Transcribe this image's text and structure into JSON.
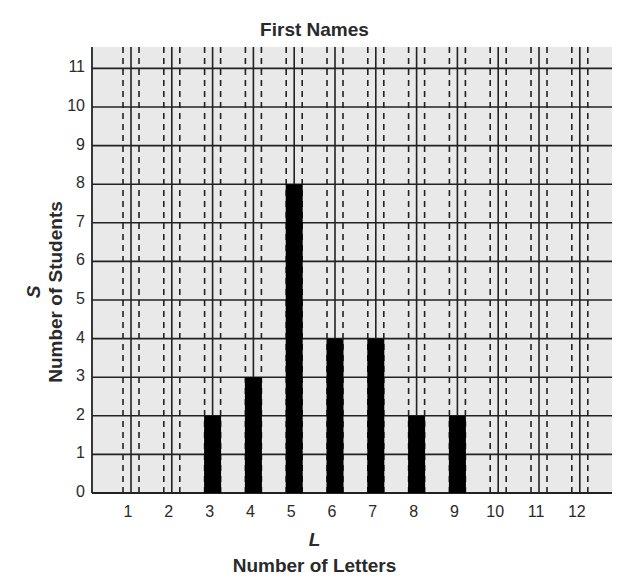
{
  "chart_data": {
    "type": "bar",
    "title": "First Names",
    "xlabel": "Number of Letters",
    "xvar": "L",
    "ylabel": "Number of Students",
    "yvar": "S",
    "categories": [
      "1",
      "2",
      "3",
      "4",
      "5",
      "6",
      "7",
      "8",
      "9",
      "10",
      "11",
      "12"
    ],
    "values": [
      0,
      0,
      2,
      3,
      8,
      4,
      4,
      2,
      2,
      0,
      0,
      0
    ],
    "ylim": [
      0,
      11
    ],
    "yticks": [
      "0",
      "1",
      "2",
      "3",
      "4",
      "5",
      "6",
      "7",
      "8",
      "9",
      "10",
      "11"
    ],
    "grid": true,
    "legend": null
  },
  "colors": {
    "bar": "#000000",
    "plot_background": "#e9e9e9",
    "grid": "#222222",
    "text": "#2a2a2a"
  }
}
